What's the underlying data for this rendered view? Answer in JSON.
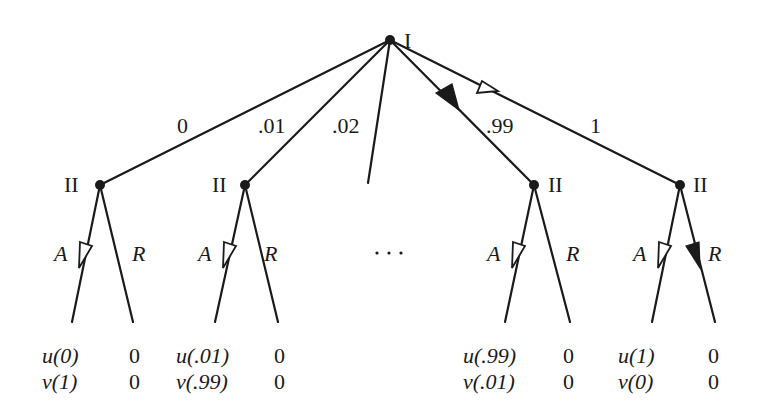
{
  "root": {
    "player": "I"
  },
  "branches": [
    {
      "label": "0",
      "player": "II",
      "payoffs": [
        [
          "u(0)",
          "0"
        ],
        [
          "v(1)",
          "0"
        ]
      ]
    },
    {
      "label": ".01",
      "player": "II",
      "payoffs": [
        [
          "u(.01)",
          "0"
        ],
        [
          "v(.99)",
          "0"
        ]
      ]
    },
    {
      "label": ".02"
    },
    {
      "label": ".99",
      "player": "II",
      "payoffs": [
        [
          "u(.99)",
          "0"
        ],
        [
          "v(.01)",
          "0"
        ]
      ]
    },
    {
      "label": "1",
      "player": "II",
      "payoffs": [
        [
          "u(1)",
          "0"
        ],
        [
          "v(0)",
          "0"
        ]
      ]
    }
  ],
  "actions": {
    "accept": "A",
    "reject": "R"
  },
  "ellipsis": "· · ·",
  "colors": {
    "line": "#1a1a1a",
    "background": "#ffffff"
  }
}
